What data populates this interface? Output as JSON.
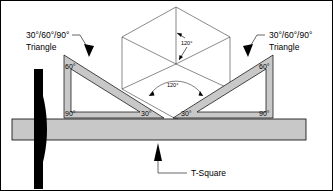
{
  "diagram": {
    "labels": {
      "triangle_left_line1": "30°/60°/90°",
      "triangle_left_line2": "Triangle",
      "triangle_right_line1": "30°/60°/90°",
      "triangle_right_line2": "Triangle",
      "tsquare": "T-Square"
    },
    "angles": {
      "left_triangle_top": "60°",
      "left_triangle_bottom": "90°",
      "left_triangle_inner": "30°",
      "right_triangle_top": "60°",
      "right_triangle_bottom": "90°",
      "right_triangle_inner": "30°",
      "cube_vertical": "120°",
      "cube_lower": "120°"
    },
    "colors": {
      "triangle_fill": "#c8c8c8",
      "triangle_stroke": "#000000",
      "blade_fill": "#c8c8c8",
      "head_fill": "#000000",
      "cube_stroke": "#3a3a3a",
      "background": "#ffffff",
      "text": "#000000"
    }
  }
}
